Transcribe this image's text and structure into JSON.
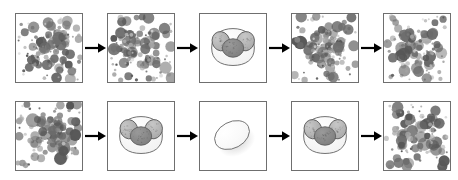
{
  "figure": {
    "background_color": "#ffffff",
    "panel_border_color": "#6f6f6f",
    "panel_fill_color": "#ffffff",
    "arrow_color": "#000000",
    "rows": [
      {
        "label": "row-1",
        "panels": [
          {
            "type": "scatter",
            "name": "cell-suspension-panel",
            "caption": ""
          },
          {
            "type": "scatter",
            "name": "cell-suspension-panel",
            "caption": ""
          },
          {
            "type": "cell-cluster",
            "name": "cell-cluster-panel",
            "caption": ""
          },
          {
            "type": "scatter",
            "name": "cell-suspension-panel",
            "caption": ""
          },
          {
            "type": "scatter",
            "name": "cell-suspension-panel",
            "caption": ""
          }
        ],
        "arrows": [
          "arrow-right",
          "arrow-right",
          "arrow-right",
          "arrow-right"
        ]
      },
      {
        "label": "row-2",
        "panels": [
          {
            "type": "scatter",
            "name": "cell-suspension-panel",
            "caption": ""
          },
          {
            "type": "cell-cluster",
            "name": "cell-cluster-panel",
            "caption": ""
          },
          {
            "type": "egg",
            "name": "egg-panel",
            "caption": ""
          },
          {
            "type": "cell-cluster",
            "name": "cell-cluster-panel",
            "caption": ""
          },
          {
            "type": "scatter",
            "name": "cell-suspension-panel",
            "caption": ""
          }
        ],
        "arrows": [
          "arrow-right",
          "arrow-right",
          "arrow-right",
          "arrow-right"
        ]
      }
    ],
    "scatter_style": {
      "dot_colors": [
        "#575757",
        "#6e6e6e",
        "#8a8a8a",
        "#a5a5a5",
        "#bfbfbf",
        "#d2d2d2"
      ],
      "dot_size_range_px": [
        1,
        6
      ],
      "dot_count": 120
    },
    "cluster_style": {
      "body_outline_color": "#5d5d5d",
      "body_fill_color": "#f2f2f2",
      "ear_fill_color": "#a8a8a8",
      "nucleus_fill_color": "#7d7d7d",
      "ear_count": 2
    },
    "egg_style": {
      "fill_color": "#f4f4f4",
      "outline_color": "#707070",
      "shadow_color": "#c9c9c9",
      "tilt_degrees": -28
    }
  }
}
